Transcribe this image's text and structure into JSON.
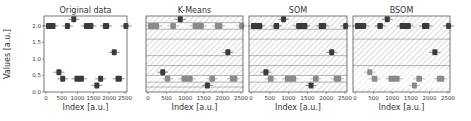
{
  "figure": {
    "ylabel": "Values [a.u.]",
    "xlabel": "Index [a.u.]"
  },
  "chart_data": [
    {
      "type": "scatter",
      "title": "Original data",
      "xlabel": "Index [a.u.]",
      "ylabel": "Values [a.u.]",
      "xlim": [
        0,
        2500
      ],
      "ylim": [
        0.0,
        2.3
      ],
      "xticks": [
        "0",
        "500",
        "1000",
        "1500",
        "2000",
        "2500"
      ],
      "yticks": [
        "0.0",
        "0.5",
        "1.0",
        "1.5",
        "2.0"
      ],
      "grid": false,
      "segments": [
        {
          "x0": 0,
          "x1": 300,
          "y": 2.0
        },
        {
          "x0": 600,
          "x1": 750,
          "y": 2.0
        },
        {
          "x0": 800,
          "x1": 820,
          "y": 2.2
        },
        {
          "x0": 1200,
          "x1": 1500,
          "y": 2.0
        },
        {
          "x0": 1800,
          "x1": 2000,
          "y": 2.0
        },
        {
          "x0": 2450,
          "x1": 2480,
          "y": 2.0
        },
        {
          "x0": 330,
          "x1": 370,
          "y": 0.6
        },
        {
          "x0": 450,
          "x1": 600,
          "y": 0.4
        },
        {
          "x0": 900,
          "x1": 1200,
          "y": 0.4
        },
        {
          "x0": 1530,
          "x1": 1570,
          "y": 0.2
        },
        {
          "x0": 1650,
          "x1": 1800,
          "y": 0.4
        },
        {
          "x0": 2080,
          "x1": 2120,
          "y": 1.2
        },
        {
          "x0": 2200,
          "x1": 2400,
          "y": 0.4
        }
      ]
    },
    {
      "type": "scatter",
      "title": "K-Means",
      "xlabel": "Index [a.u.]",
      "xlim": [
        0,
        2500
      ],
      "xticks": [
        "0",
        "500",
        "1000",
        "1500",
        "2000",
        "2500"
      ],
      "hatched_bands": true,
      "band_lines": [
        0.15,
        0.3,
        0.5,
        0.8,
        1.1,
        1.6,
        1.9,
        2.1
      ],
      "highlighted_segments": [
        {
          "y": 2.0,
          "shade": "light"
        },
        {
          "y": 0.4,
          "shade": "light"
        }
      ]
    },
    {
      "type": "scatter",
      "title": "SOM",
      "xlabel": "Index [a.u.]",
      "xlim": [
        0,
        2500
      ],
      "xticks": [
        "0",
        "500",
        "1000",
        "1500",
        "2000",
        "2500"
      ],
      "hatched_bands": true,
      "band_lines": [
        0.3,
        0.5,
        0.8,
        1.1,
        1.6,
        1.9
      ],
      "highlighted_segments": [
        {
          "y": 0.4,
          "shade": "light"
        }
      ]
    },
    {
      "type": "scatter",
      "title": "BSOM",
      "xlabel": "Index [a.u.]",
      "xlim": [
        0,
        2500
      ],
      "xticks": [
        "0",
        "500",
        "1000",
        "1500",
        "2000",
        "2500"
      ],
      "hatched_bands": true,
      "band_lines": [
        0.8,
        1.6
      ],
      "highlighted_segments": [
        {
          "y": 0.4,
          "shade": "light"
        },
        {
          "y": 0.6,
          "shade": "light"
        },
        {
          "y": 0.2,
          "shade": "light"
        }
      ]
    }
  ],
  "colors": {
    "dark_marker": "#3a3a3a",
    "light_marker": "#8a8a8a",
    "hatch": "#b0b0b0",
    "axis": "#555555",
    "band_line": "#888888"
  }
}
